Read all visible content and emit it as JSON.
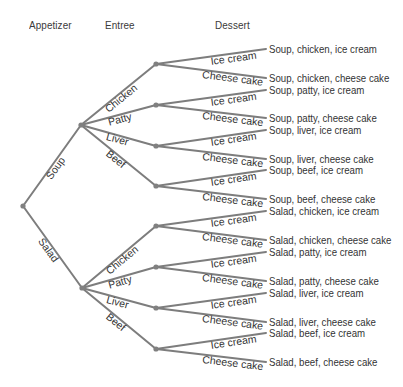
{
  "diagram": {
    "type": "tree",
    "colors": {
      "line": "#7d7d7d",
      "node": "#808080",
      "text": "#333333"
    },
    "headers": [
      {
        "label": "Appetizer",
        "x": 29,
        "y": 19
      },
      {
        "label": "Entree",
        "x": 105,
        "y": 19
      },
      {
        "label": "Dessert",
        "x": 215,
        "y": 19
      }
    ],
    "root": {
      "x": 23,
      "y": 206
    },
    "appetizers": [
      {
        "label": "Soup",
        "x": 81,
        "y": 125,
        "entrees": [
          {
            "label": "Chicken",
            "x": 156,
            "y": 64,
            "desserts": [
              {
                "label": "Ice cream",
                "end_y": 49,
                "outcome": "Soup, chicken, ice cream"
              },
              {
                "label": "Cheese cake",
                "end_y": 78,
                "outcome": "Soup, chicken, cheese cake"
              }
            ]
          },
          {
            "label": "Patty",
            "x": 156,
            "y": 105,
            "desserts": [
              {
                "label": "Ice cream",
                "end_y": 90,
                "outcome": "Soup, patty, ice cream"
              },
              {
                "label": "Cheese cake",
                "end_y": 118,
                "outcome": "Soup, patty, cheese cake"
              }
            ]
          },
          {
            "label": "Liver",
            "x": 156,
            "y": 146,
            "desserts": [
              {
                "label": "Ice cream",
                "end_y": 130,
                "outcome": "Soup, liver, ice cream"
              },
              {
                "label": "Cheese cake",
                "end_y": 159,
                "outcome": "Soup, liver, cheese cake"
              }
            ]
          },
          {
            "label": "Beef",
            "x": 156,
            "y": 186,
            "desserts": [
              {
                "label": "Ice cream",
                "end_y": 170,
                "outcome": "Soup, beef, ice cream"
              },
              {
                "label": "Cheese cake",
                "end_y": 199,
                "outcome": "Soup, beef, cheese cake"
              }
            ]
          }
        ]
      },
      {
        "label": "Salad",
        "x": 82,
        "y": 288,
        "entrees": [
          {
            "label": "Chicken",
            "x": 156,
            "y": 226,
            "desserts": [
              {
                "label": "Ice cream",
                "end_y": 211,
                "outcome": "Salad, chicken, ice cream"
              },
              {
                "label": "Cheese cake",
                "end_y": 240,
                "outcome": "Salad, chicken, cheese cake"
              }
            ]
          },
          {
            "label": "Patty",
            "x": 156,
            "y": 267,
            "desserts": [
              {
                "label": "Ice cream",
                "end_y": 252,
                "outcome": "Salad, patty, ice cream"
              },
              {
                "label": "Cheese cake",
                "end_y": 281,
                "outcome": "Salad, patty, cheese cake"
              }
            ]
          },
          {
            "label": "Liver",
            "x": 156,
            "y": 308,
            "desserts": [
              {
                "label": "Ice cream",
                "end_y": 293,
                "outcome": "Salad, liver, ice cream"
              },
              {
                "label": "Cheese cake",
                "end_y": 322,
                "outcome": "Salad, liver, cheese cake"
              }
            ]
          },
          {
            "label": "Beef",
            "x": 156,
            "y": 349,
            "desserts": [
              {
                "label": "Ice cream",
                "end_y": 333,
                "outcome": "Salad, beef, ice cream"
              },
              {
                "label": "Cheese cake",
                "end_y": 362,
                "outcome": "Salad, beef, cheese cake"
              }
            ]
          }
        ]
      }
    ],
    "leaf_end_x": 266
  }
}
